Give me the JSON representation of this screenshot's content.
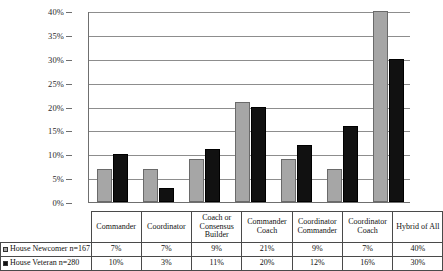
{
  "chart_data": {
    "type": "bar",
    "title": "",
    "xlabel": "",
    "ylabel": "",
    "ylim": [
      0,
      40
    ],
    "ytick_labels": [
      "40%",
      "35%",
      "30%",
      "25%",
      "20%",
      "15%",
      "10%",
      "5%",
      "0%"
    ],
    "ytick_values": [
      40,
      35,
      30,
      25,
      20,
      15,
      10,
      5,
      0
    ],
    "grid": true,
    "legend_position": "bottom-left-table",
    "categories": [
      "Commander",
      "Coordinator",
      "Coach or Consensus Builder",
      "Commander Coach",
      "Coordinator Commander",
      "Coordinator Coach",
      "Hybrid of All"
    ],
    "series": [
      {
        "name": "House Newcomer n=167",
        "color": "#a6a6a6",
        "values": [
          7,
          7,
          9,
          21,
          9,
          7,
          40
        ],
        "labels": [
          "7%",
          "7%",
          "9%",
          "21%",
          "9%",
          "7%",
          "40%"
        ]
      },
      {
        "name": "House Veteran n=280",
        "color": "#111111",
        "values": [
          10,
          3,
          11,
          20,
          12,
          16,
          30
        ],
        "labels": [
          "10%",
          "3%",
          "11%",
          "20%",
          "12%",
          "16%",
          "30%"
        ]
      }
    ]
  },
  "table": {
    "corner_label": "",
    "column_headers": [
      "Commander",
      "Coordinator",
      "Coach or Consensus Builder",
      "Commander Coach",
      "Coordinator Commander",
      "Coordinator Coach",
      "Hybrid of All"
    ],
    "rows": [
      {
        "label": "House Newcomer n=167",
        "swatch": "series-0-swatch",
        "values": [
          "7%",
          "7%",
          "9%",
          "21%",
          "9%",
          "7%",
          "40%"
        ]
      },
      {
        "label": "House Veteran n=280",
        "swatch": "series-1-swatch",
        "values": [
          "10%",
          "3%",
          "11%",
          "20%",
          "12%",
          "16%",
          "30%"
        ]
      }
    ]
  }
}
